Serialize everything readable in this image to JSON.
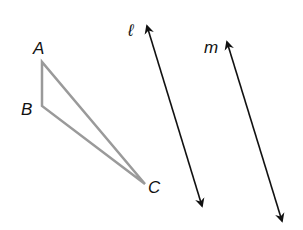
{
  "diagram": {
    "type": "geometry",
    "colors": {
      "triangle": "#9a9a9a",
      "lines": "#111111",
      "labels": "#111111",
      "background": "#ffffff"
    },
    "triangle": {
      "vertices": [
        {
          "label": "A",
          "x": 42,
          "y": 62
        },
        {
          "label": "B",
          "x": 42,
          "y": 106
        },
        {
          "label": "C",
          "x": 145,
          "y": 184
        }
      ]
    },
    "lines": [
      {
        "label": "ℓ",
        "x1": 147,
        "y1": 22,
        "x2": 203,
        "y2": 210
      },
      {
        "label": "m",
        "x1": 226,
        "y1": 38,
        "x2": 283,
        "y2": 225
      }
    ],
    "labels": {
      "A": "A",
      "B": "B",
      "C": "C",
      "l": "ℓ",
      "m": "m"
    }
  }
}
